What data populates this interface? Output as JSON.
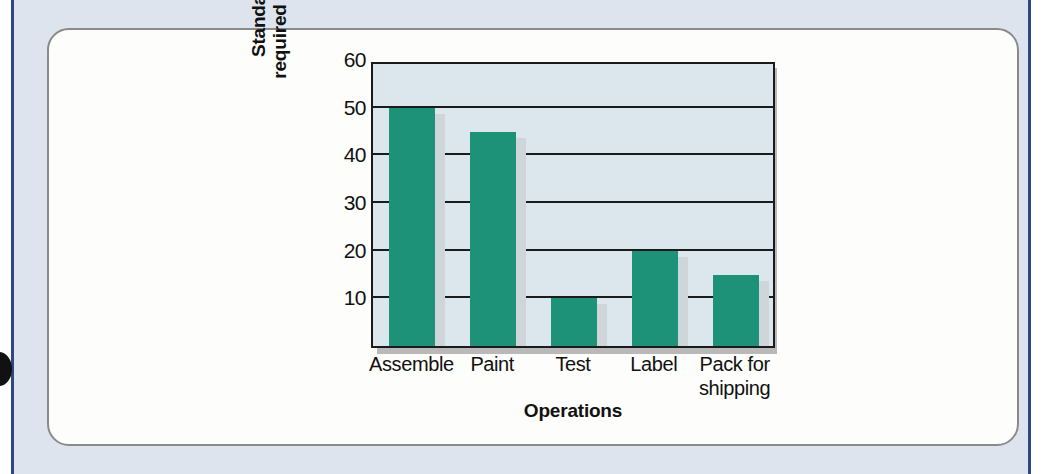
{
  "colors": {
    "bar": "#1d9279",
    "plot_background": "#dce7ed",
    "axis": "#1b1b1b",
    "page_band": "#dde4ee",
    "gutter_rule": "#2c4a80",
    "card_border": "#8a8a8a",
    "bar_shadow": "#cfd6da"
  },
  "chart_data": {
    "type": "bar",
    "title": "",
    "subtitle": "",
    "categories": [
      "Assemble",
      "Paint",
      "Test",
      "Label",
      "Pack for shipping"
    ],
    "category_lines": [
      [
        "Assemble"
      ],
      [
        "Paint"
      ],
      [
        "Test"
      ],
      [
        "Label"
      ],
      [
        "Pack for",
        "shipping"
      ]
    ],
    "values": [
      50,
      45,
      10,
      20,
      15
    ],
    "xlabel": "Operations",
    "ylabel": "Standard time required (seconds)",
    "ylabel_lines": [
      "Standard time",
      "required (seconds)"
    ],
    "ylim": [
      0,
      60
    ],
    "ytick_values": [
      10,
      20,
      30,
      40,
      50,
      60
    ],
    "ytick_labels": [
      "10",
      "20",
      "30",
      "40",
      "50",
      "60"
    ],
    "ytick_step": 10,
    "grid": true,
    "legend": null,
    "legend_position": "none",
    "annotations": []
  }
}
